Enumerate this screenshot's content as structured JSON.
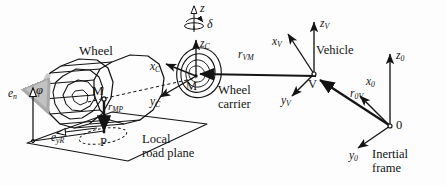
{
  "figure": {
    "background_color": "#fdfdfd",
    "ink_color": "#141414",
    "accent_gray": "#b9b9b9"
  },
  "labels": {
    "wheel": "Wheel",
    "wheel_carrier_line1": "Wheel",
    "wheel_carrier_line2": "carrier",
    "local_road_line1": "Local",
    "local_road_line2": "road plane",
    "vehicle": "Vehicle",
    "inertial_line1": "Inertial",
    "inertial_line2": "frame"
  },
  "points": {
    "wheel_center": "M",
    "contact_point": "P",
    "carrier_center": "M",
    "vehicle_origin": "V",
    "inertial_origin": "0"
  },
  "axes": {
    "steering_axis": "z",
    "steering_angle": "δ",
    "wheel_spin_angle": "φ",
    "carrier_x": {
      "base": "x",
      "sub": "C"
    },
    "carrier_y": {
      "base": "y",
      "sub": "C"
    },
    "carrier_z": {
      "base": "z",
      "sub": "C"
    },
    "vehicle_x": {
      "base": "x",
      "sub": "V"
    },
    "vehicle_y": {
      "base": "y",
      "sub": "V"
    },
    "vehicle_z": {
      "base": "z",
      "sub": "V"
    },
    "inertial_x": {
      "base": "x",
      "sub": "0"
    },
    "inertial_y": {
      "base": "y",
      "sub": "0"
    },
    "inertial_z": {
      "base": "z",
      "sub": "0"
    }
  },
  "vectors": {
    "r_MP": {
      "base": "r",
      "sub": "MP"
    },
    "r_VM": {
      "base": "r",
      "sub": "VM"
    },
    "r_0V": {
      "base": "r",
      "sub": "0V"
    },
    "e_n": {
      "base": "e",
      "sub": "n"
    },
    "e_yR": {
      "base": "e",
      "sub": "yR"
    }
  }
}
